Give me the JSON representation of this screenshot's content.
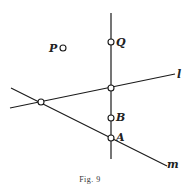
{
  "figure": {
    "caption": "Fig. 9",
    "lines": [
      {
        "name": "l",
        "label": "l"
      },
      {
        "name": "m",
        "label": "m"
      },
      {
        "name": "vertical",
        "label": ""
      }
    ],
    "points": [
      {
        "name": "P",
        "label": "P"
      },
      {
        "name": "Q",
        "label": "Q"
      },
      {
        "name": "B",
        "label": "B"
      },
      {
        "name": "A",
        "label": "A"
      }
    ]
  }
}
